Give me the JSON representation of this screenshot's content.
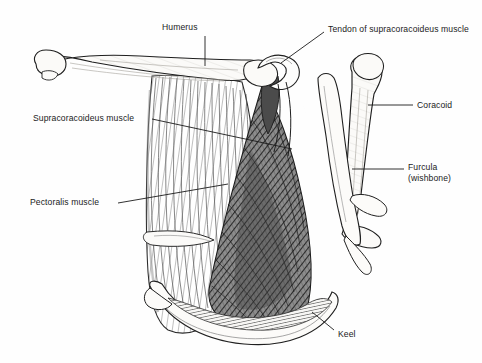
{
  "figure": {
    "background_color": "#ffffff",
    "ink_color": "#1b1b1b",
    "shade_color": "#6d6d6d"
  },
  "labels": [
    {
      "id": "humerus",
      "text": "Humerus",
      "lines": [
        "Humerus"
      ],
      "x": 162,
      "y": 22,
      "leader": {
        "points": "205,36 205,66"
      }
    },
    {
      "id": "tendon-of-supracoracoideus-muscle",
      "text": "Tendon of supracoracoideus muscle",
      "lines": [
        "Tendon of supracoracoideus",
        "muscle"
      ],
      "x": 328,
      "y": 24,
      "leader": {
        "points": "324,32 281,63"
      }
    },
    {
      "id": "coracoid",
      "text": "Coracoid",
      "lines": [
        "Coracoid"
      ],
      "x": 417,
      "y": 100,
      "leader": {
        "points": "413,105 368,105"
      }
    },
    {
      "id": "supracoracoideus-muscle",
      "text": "Supracoracoideus muscle",
      "lines": [
        "Supracoracoideus muscle"
      ],
      "x": 33,
      "y": 113,
      "leader": {
        "points": "152,119 292,149"
      }
    },
    {
      "id": "furcula-wishbone",
      "text": "Furcula (wishbone)",
      "lines": [
        "Furcula",
        "(wishbone)"
      ],
      "x": 408,
      "y": 162,
      "leader": {
        "points": "404,169 352,169"
      }
    },
    {
      "id": "pectoralis-muscle",
      "text": "Pectoralis muscle",
      "lines": [
        "Pectoralis muscle"
      ],
      "x": 30,
      "y": 197,
      "leader": {
        "points": "118,203 228,184"
      }
    },
    {
      "id": "keel",
      "text": "Keel",
      "lines": [
        "Keel"
      ],
      "x": 338,
      "y": 329,
      "leader": {
        "points": "334,330 312,312"
      }
    }
  ],
  "structures": [
    {
      "id": "humerus-bone",
      "name": "humerus"
    },
    {
      "id": "tendon-loop",
      "name": "tendon of supracoracoideus over triosseal canal"
    },
    {
      "id": "coracoid-bone",
      "name": "coracoid"
    },
    {
      "id": "furcula-bone",
      "name": "furcula (wishbone)"
    },
    {
      "id": "pectoralis-muscle-mass",
      "name": "pectoralis muscle"
    },
    {
      "id": "supracoracoideus-muscle-mass",
      "name": "supracoracoideus muscle"
    },
    {
      "id": "keel-bone",
      "name": "keel (carina of sternum)"
    },
    {
      "id": "rib",
      "name": "rib"
    }
  ]
}
